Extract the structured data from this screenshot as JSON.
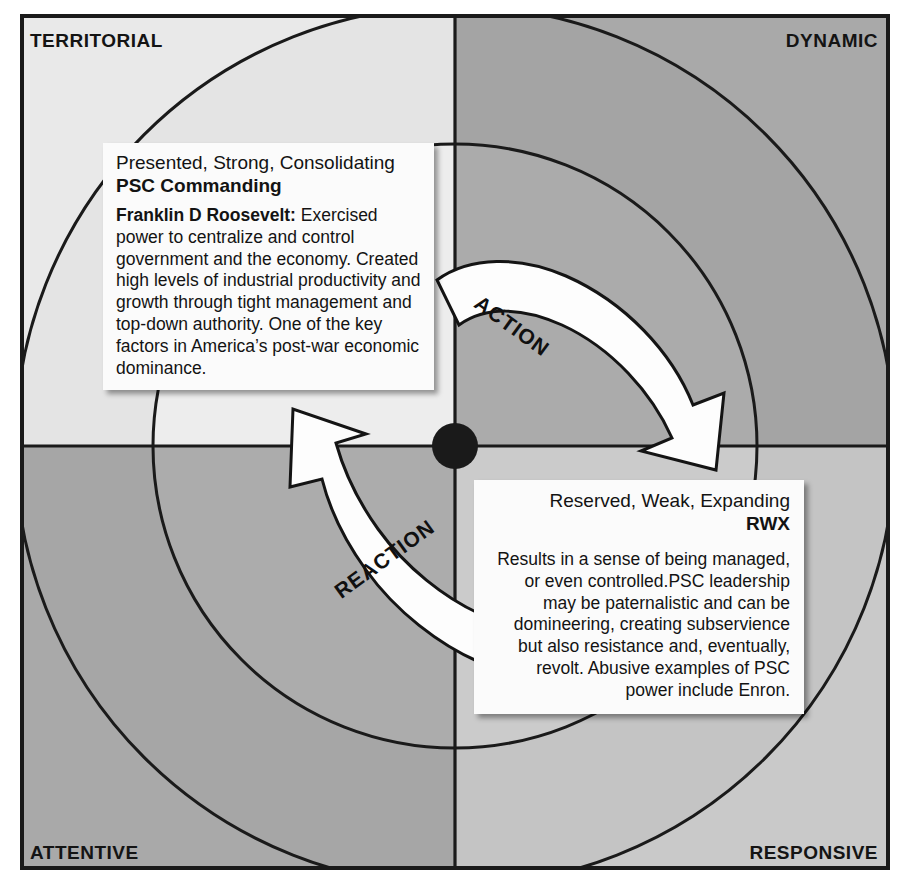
{
  "diagram": {
    "frame": {
      "border_color": "#1a1a1a",
      "outer_background": "#ffffff"
    },
    "quadrants": [
      {
        "id": "top-left",
        "label": "TERRITORIAL",
        "fill": "#e9e9e9"
      },
      {
        "id": "top-right",
        "label": "DYNAMIC",
        "fill": "#a9a9a9"
      },
      {
        "id": "bottom-left",
        "label": "ATTENTIVE",
        "fill": "#a9a9a9"
      },
      {
        "id": "bottom-right",
        "label": "RESPONSIVE",
        "fill": "#c9c9c9"
      }
    ],
    "center_dot": {
      "color": "#1a1a1a",
      "cx": 455,
      "cy": 446,
      "r": 23
    },
    "rings": [
      {
        "name": "inner-ring",
        "r": 302
      },
      {
        "name": "outer-ring",
        "r": 440
      }
    ]
  },
  "arrows": {
    "action": {
      "label": "ACTION",
      "direction": "clockwise-down-right",
      "fill": "#fdfdfd",
      "stroke": "#141414"
    },
    "reaction": {
      "label": "REACTION",
      "direction": "counter-clockwise-up-left",
      "fill": "#fdfdfd",
      "stroke": "#141414"
    }
  },
  "callouts": {
    "psc": {
      "line1": "Presented, Strong, Consolidating",
      "line2": "PSC Commanding",
      "body_lead": "Franklin D Roosevelt:",
      "body_text": " Exercised power to centralize and control government and the economy. Created high levels of industrial productivity and growth through tight management and top-down authority. One of the key factors in America’s post-war economic dominance."
    },
    "rwx": {
      "line1": "Reserved, Weak, Expanding",
      "line2": "RWX",
      "body_text": "Results in a sense of being managed, or even controlled.PSC leadership may be paternalistic and can be domineering, creating subservience but also resistance and, eventually, revolt. Abusive examples of  PSC power include Enron."
    }
  }
}
